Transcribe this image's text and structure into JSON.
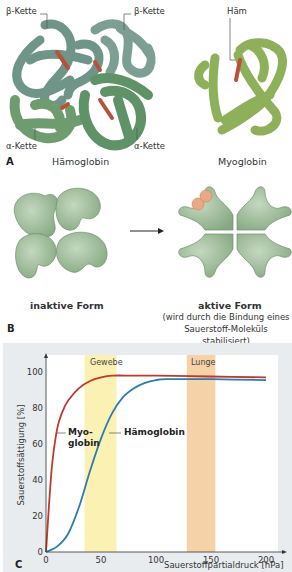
{
  "panel_a": {
    "letter": "A",
    "labels": {
      "beta_left": "β-Kette",
      "beta_right": "β-Kette",
      "alpha_left": "α-Kette",
      "alpha_right": "α-Kette",
      "heme": "Häm"
    },
    "captions": {
      "hemoglobin": "Hämoglobin",
      "myoglobin": "Myoglobin"
    },
    "colors": {
      "beta_chain": "#6f9488",
      "alpha_chain": "#6e9c6f",
      "myoglobin": "#8fb05a",
      "heme": "#b9503a"
    }
  },
  "panel_b": {
    "letter": "B",
    "inactive_label": "inaktive Form",
    "active_label": "aktive Form",
    "active_note_line1": "(wird durch die Bindung eines",
    "active_note_line2": "Sauerstoff-Moleküls stabilisiert)",
    "colors": {
      "subunit": "#9dbb97",
      "oxygen": "#eaa985"
    }
  },
  "panel_c": {
    "letter": "C",
    "curve_labels": {
      "myoglobin_line1": "Myo-",
      "myoglobin_line2": "globin",
      "hemoglobin": "Hämoglobin"
    },
    "band_labels": {
      "tissue": "Gewebe",
      "lung": "Lunge"
    }
  },
  "chart_data": {
    "type": "line",
    "title": "",
    "xlabel": "Sauerstoffpartialdruck [hPa]",
    "ylabel": "Sauerstoffsättigung [%]",
    "xlim": [
      0,
      210
    ],
    "ylim": [
      0,
      110
    ],
    "xticks": [
      0,
      50,
      100,
      150,
      200
    ],
    "yticks": [
      0,
      20,
      40,
      60,
      80,
      100
    ],
    "grid": false,
    "legend": "inline labels",
    "series": [
      {
        "name": "Myoglobin",
        "color": "#c0392b",
        "x": [
          0,
          5,
          10,
          15,
          20,
          30,
          40,
          50,
          60,
          80,
          100,
          150,
          200
        ],
        "y": [
          0,
          45,
          68,
          78,
          84,
          91,
          95,
          97,
          98,
          98,
          98,
          97.5,
          97
        ]
      },
      {
        "name": "Hämoglobin",
        "color": "#2e7bb0",
        "x": [
          0,
          10,
          20,
          30,
          40,
          50,
          60,
          70,
          80,
          90,
          100,
          110,
          150,
          200
        ],
        "y": [
          0,
          3,
          10,
          25,
          45,
          63,
          77,
          86,
          91,
          94,
          95.5,
          96,
          96,
          95.5
        ]
      }
    ],
    "bands": [
      {
        "name": "Gewebe",
        "x_from": 35,
        "x_to": 64,
        "color": "#fbf1b3"
      },
      {
        "name": "Lunge",
        "x_from": 128,
        "x_to": 154,
        "color": "#f6d2a8"
      }
    ]
  }
}
